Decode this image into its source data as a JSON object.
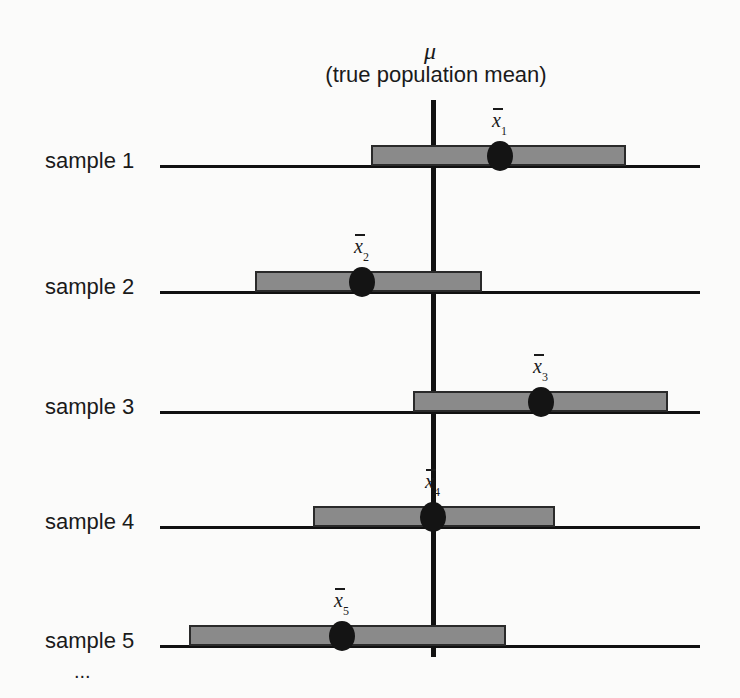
{
  "title": {
    "symbol": "μ",
    "caption": "(true population mean)"
  },
  "mu_x": 433,
  "samples": [
    {
      "label": "sample 1",
      "mean_symbol": "x",
      "subscript": "1",
      "line_y": 166,
      "bar_left": 371,
      "bar_right": 626,
      "dot_x": 500
    },
    {
      "label": "sample 2",
      "mean_symbol": "x",
      "subscript": "2",
      "line_y": 292,
      "bar_left": 255,
      "bar_right": 482,
      "dot_x": 362
    },
    {
      "label": "sample 3",
      "mean_symbol": "x",
      "subscript": "3",
      "line_y": 412,
      "bar_left": 413,
      "bar_right": 668,
      "dot_x": 541
    },
    {
      "label": "sample 4",
      "mean_symbol": "x",
      "subscript": "4",
      "line_y": 527,
      "bar_left": 313,
      "bar_right": 555,
      "dot_x": 433
    },
    {
      "label": "sample 5",
      "mean_symbol": "x",
      "subscript": "5",
      "line_y": 646,
      "bar_left": 189,
      "bar_right": 506,
      "dot_x": 342
    }
  ],
  "ellipsis": "...",
  "colors": {
    "bar_fill": "#8a8a8a",
    "dot": "#141414",
    "lines": "#111111"
  }
}
